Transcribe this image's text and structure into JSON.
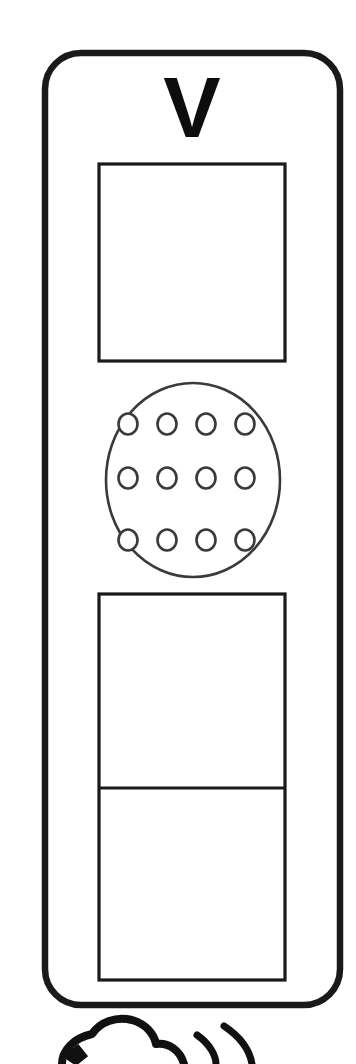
{
  "artwork": {
    "title": "Intercom Handset Line Drawing",
    "style": "black-line-art-on-white",
    "stroke_color": "#1a1a1a",
    "fill_color": "#ffffff",
    "background_color": "#ffffff",
    "canvas": {
      "width": 356,
      "height": 1064
    }
  },
  "device": {
    "name": "vertical-intercom-unit",
    "body": {
      "label": "device-body-outline",
      "x": 45,
      "y": 53,
      "width": 295,
      "height": 952,
      "corner_radius": 36,
      "stroke_width": 6
    },
    "brand": {
      "label": "V",
      "x": 192,
      "y": 137,
      "font_size": 86
    },
    "display": {
      "label": "display-screen",
      "x": 99,
      "y": 164,
      "width": 186,
      "height": 197,
      "stroke_width": 3
    },
    "speaker": {
      "label": "speaker-grille",
      "outline": {
        "cx": 193,
        "cy": 480,
        "rx": 87,
        "ry": 97
      },
      "rows": [
        {
          "row": 1,
          "cy": 424,
          "count": 4,
          "cx": [
            128,
            167,
            206,
            245
          ],
          "r": 9
        },
        {
          "row": 2,
          "cy": 478,
          "count": 4,
          "cx": [
            128,
            167,
            206,
            245
          ],
          "r": 9
        },
        {
          "row": 3,
          "cy": 540,
          "count": 4,
          "cx": [
            128,
            167,
            206,
            245
          ],
          "r": 9
        }
      ],
      "hole_count": 12
    },
    "keypad_panel": {
      "label": "lower-panel",
      "x": 99,
      "y": 594,
      "width": 186,
      "height": 386,
      "stroke_width": 3,
      "divider_y": 788,
      "sections": [
        {
          "name": "upper-section",
          "y": 594,
          "height": 194
        },
        {
          "name": "lower-section",
          "y": 788,
          "height": 192
        }
      ]
    }
  },
  "foreground_sketch": {
    "name": "sound-waves-figure",
    "description": "partially cropped rounded-blob figure with two arc sound waves at bottom edge",
    "blob": {
      "cx": 128,
      "cy": 1068,
      "rx": 46,
      "ry": 32
    },
    "arcs": [
      {
        "name": "inner-sound-arc",
        "cx": 190,
        "cy": 1072
      },
      {
        "name": "outer-sound-arc",
        "cx": 190,
        "cy": 1072
      }
    ],
    "stroke_width": 7
  }
}
